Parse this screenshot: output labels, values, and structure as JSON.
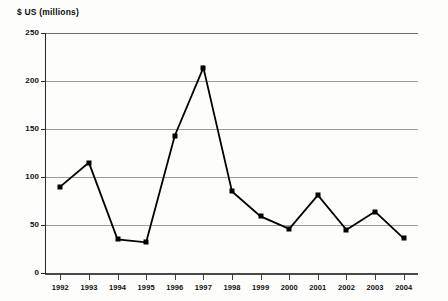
{
  "chart_data": {
    "type": "line",
    "title": "",
    "ylabel": "$ US (millions)",
    "xlabel": "",
    "categories": [
      "1992",
      "1993",
      "1994",
      "1995",
      "1996",
      "1997",
      "1998",
      "1999",
      "2000",
      "2001",
      "2002",
      "2003",
      "2004"
    ],
    "values": [
      90,
      115,
      35,
      32,
      143,
      214,
      85,
      59,
      46,
      81,
      45,
      64,
      36
    ],
    "ylim": [
      0,
      250
    ],
    "yticks": [
      0,
      50,
      100,
      150,
      200,
      250
    ],
    "ytick_labels": [
      "0",
      "50",
      "100",
      "150",
      "200",
      "250"
    ],
    "grid": true,
    "legend": false,
    "series_color": "#000000",
    "gridline_color": "#9b9b9b",
    "marker": "square",
    "background_color": "#fdfdfc"
  }
}
